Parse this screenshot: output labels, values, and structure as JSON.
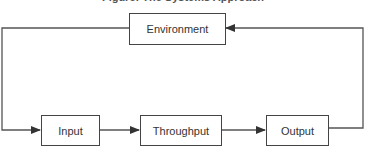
{
  "diagram": {
    "caption": "Figure: The Systems Approach",
    "nodes": [
      {
        "id": "environment",
        "label": "Environment"
      },
      {
        "id": "input",
        "label": "Input"
      },
      {
        "id": "throughput",
        "label": "Throughput"
      },
      {
        "id": "output",
        "label": "Output"
      }
    ],
    "edges": [
      {
        "from": "input",
        "to": "throughput"
      },
      {
        "from": "throughput",
        "to": "output"
      },
      {
        "from": "output",
        "to": "environment",
        "route": "right-loop"
      },
      {
        "from": "environment",
        "to": "input",
        "route": "left-loop"
      }
    ],
    "colors": {
      "line": "#444444",
      "background": "#ffffff"
    }
  }
}
